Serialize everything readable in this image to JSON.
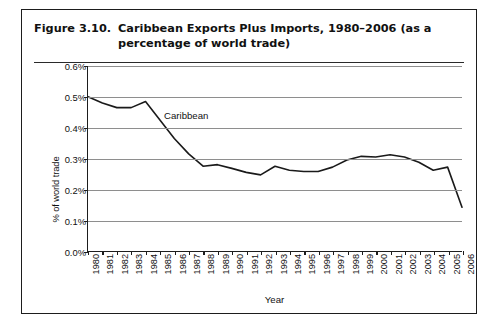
{
  "figure": {
    "number": "Figure 3.10.",
    "title": "Caribbean Exports Plus Imports, 1980–2006 (as a percentage of world trade)"
  },
  "chart_data": {
    "type": "line",
    "title": "Caribbean Exports Plus Imports, 1980–2006 (as a percentage of world trade)",
    "xlabel": "Year",
    "ylabel": "% of world trade",
    "ylim": [
      0.0,
      0.6
    ],
    "ytick_labels": [
      "0.6%",
      "0.5%",
      "0.4%",
      "0.3%",
      "0.2%",
      "0.1%",
      "0.0%"
    ],
    "ytick_values": [
      0.6,
      0.5,
      0.4,
      0.3,
      0.2,
      0.1,
      0.0
    ],
    "grid": true,
    "legend": "inline-annotation",
    "annotations": [
      {
        "text": "Caribbean",
        "x": 1985,
        "y": 0.44
      }
    ],
    "categories": [
      "1980",
      "1981",
      "1982",
      "1983",
      "1984",
      "1985",
      "1986",
      "1987",
      "1988",
      "1989",
      "1990",
      "1991",
      "1992",
      "1993",
      "1994",
      "1995",
      "1996",
      "1997",
      "1998",
      "1999",
      "2000",
      "2001",
      "2002",
      "2003",
      "2004",
      "2005",
      "2006"
    ],
    "series": [
      {
        "name": "Caribbean",
        "color": "#1a1a1a",
        "values": [
          0.5,
          0.48,
          0.465,
          0.465,
          0.485,
          0.425,
          0.365,
          0.315,
          0.275,
          0.28,
          0.268,
          0.255,
          0.247,
          0.275,
          0.262,
          0.258,
          0.258,
          0.272,
          0.295,
          0.307,
          0.305,
          0.312,
          0.305,
          0.288,
          0.262,
          0.272,
          0.142
        ]
      }
    ]
  }
}
